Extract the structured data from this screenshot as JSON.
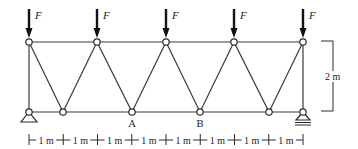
{
  "diagram": {
    "type": "truss",
    "top_chord_y": 42,
    "bottom_chord_y": 112,
    "top_nodes_x": [
      29,
      97,
      166,
      234,
      303
    ],
    "bottom_nodes_x": [
      29,
      63,
      132,
      200,
      269,
      303
    ],
    "load_label": "F",
    "loads_count": 5,
    "node_labels": [
      {
        "text": "A",
        "bottom_index": 2
      },
      {
        "text": "B",
        "bottom_index": 3
      }
    ],
    "height_label": "2 m",
    "span_labels": [
      "1 m",
      "1 m",
      "1 m",
      "1 m",
      "1 m",
      "1 m",
      "1 m",
      "1 m"
    ],
    "supports": {
      "left": "pin",
      "right": "roller"
    },
    "colors": {
      "line": "#3a3a3a",
      "arrow": "#111111",
      "background": "#ffffff"
    }
  }
}
